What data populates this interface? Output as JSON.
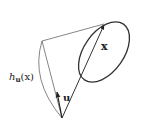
{
  "diagram": {
    "labels": {
      "support_function_base": "h",
      "support_function_sub": "u",
      "support_function_arg": "(x)",
      "vector_x": "x",
      "vector_u": "u"
    },
    "colors": {
      "stroke": "#444444",
      "thin_stroke": "#666666",
      "text": "#222222"
    }
  }
}
